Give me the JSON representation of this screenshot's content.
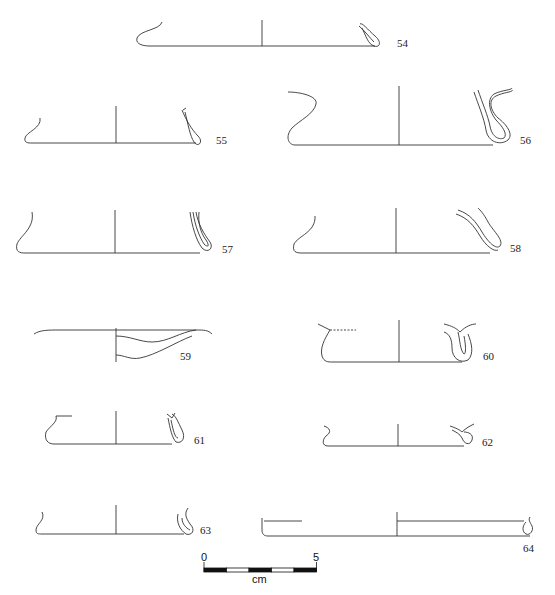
{
  "figure": {
    "type": "vessel-rim-profile-drawings",
    "profiles": [
      {
        "id": "54",
        "label": "54"
      },
      {
        "id": "55",
        "label": "55"
      },
      {
        "id": "56",
        "label": "56"
      },
      {
        "id": "57",
        "label": "57"
      },
      {
        "id": "58",
        "label": "58"
      },
      {
        "id": "59",
        "label": "59"
      },
      {
        "id": "60",
        "label": "60"
      },
      {
        "id": "61",
        "label": "61"
      },
      {
        "id": "62",
        "label": "62"
      },
      {
        "id": "63",
        "label": "63"
      },
      {
        "id": "64",
        "label": "64"
      }
    ],
    "scale_bar": {
      "start_label": "0",
      "end_label": "5",
      "unit_label": "cm",
      "segments": 5
    },
    "colors": {
      "line": "#333333",
      "scale_fill": "#111111",
      "background": "#ffffff"
    }
  }
}
